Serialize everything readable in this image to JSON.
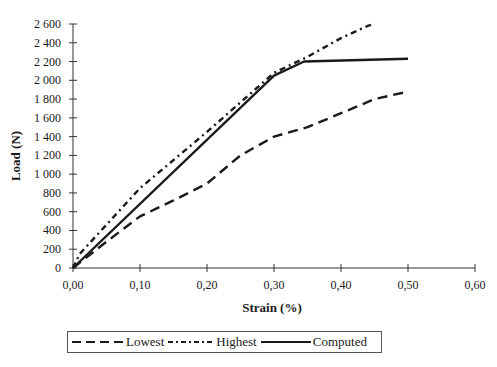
{
  "chart_data": {
    "type": "line",
    "title": "",
    "xlabel": "Strain (%)",
    "ylabel": "Load (N)",
    "xlim": [
      0,
      0.6
    ],
    "ylim": [
      0,
      2600
    ],
    "x_ticks": [
      "0,00",
      "0,10",
      "0,20",
      "0,30",
      "0,40",
      "0,50",
      "0,60"
    ],
    "y_ticks": [
      "0",
      "200",
      "400",
      "600",
      "800",
      "1 000",
      "1 200",
      "1 400",
      "1 600",
      "1 800",
      "2 000",
      "2 200",
      "2 400",
      "2 600"
    ],
    "grid": false,
    "legend_position": "bottom",
    "series": [
      {
        "name": "Lowest",
        "style": "dashed",
        "x": [
          0,
          0.05,
          0.1,
          0.15,
          0.2,
          0.25,
          0.3,
          0.35,
          0.4,
          0.45,
          0.5
        ],
        "y": [
          0,
          280,
          550,
          720,
          900,
          1200,
          1400,
          1500,
          1650,
          1800,
          1880
        ]
      },
      {
        "name": "Highest",
        "style": "dash-dot",
        "x": [
          0,
          0.01,
          0.1,
          0.2,
          0.3,
          0.35,
          0.4,
          0.44,
          0.45
        ],
        "y": [
          0,
          150,
          850,
          1450,
          2080,
          2250,
          2450,
          2580,
          2600
        ]
      },
      {
        "name": "Computed",
        "style": "solid",
        "x": [
          0,
          0.3,
          0.345,
          0.5
        ],
        "y": [
          0,
          2050,
          2200,
          2230
        ]
      }
    ]
  },
  "legend": {
    "items": [
      "Lowest",
      "Highest",
      "Computed"
    ]
  }
}
